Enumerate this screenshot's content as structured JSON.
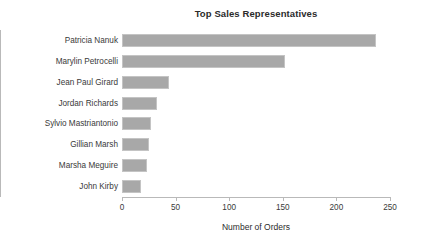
{
  "chart_data": {
    "type": "bar",
    "orientation": "horizontal",
    "title": "Top Sales Representatives",
    "xlabel": "Number of Orders",
    "ylabel": "",
    "categories": [
      "Patricia Nanuk",
      "Marylin Petrocelli",
      "Jean Paul Girard",
      "Jordan Richards",
      "Sylvio Mastriantonio",
      "Gillian Marsh",
      "Marsha Meguire",
      "John Kirby"
    ],
    "values": [
      237,
      152,
      44,
      33,
      27,
      25,
      23,
      18
    ],
    "xlim": [
      0,
      250
    ],
    "xticks": [
      0,
      50,
      100,
      150,
      200,
      250
    ],
    "xtick_labels": [
      "0",
      "50",
      "100",
      "150",
      "200",
      "250"
    ],
    "grid": false,
    "legend": false,
    "bar_color": "#a8a8a8",
    "bar_edge_color": "#c4c4c4",
    "axis_color": "#b9b9b9",
    "background_color": "#ffffff"
  }
}
